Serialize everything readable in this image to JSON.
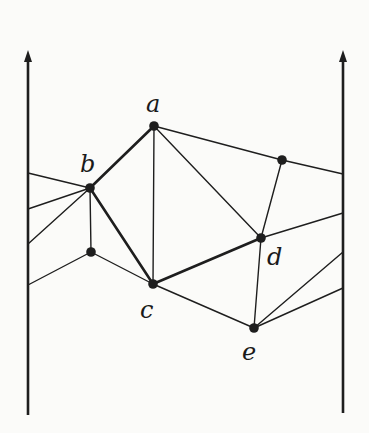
{
  "diagram": {
    "type": "planar-subdivision-between-walls",
    "colors": {
      "ink": "#1e1e1e",
      "background": "#fbfbf9"
    },
    "boundaries": [
      {
        "name": "left-wall",
        "x": 28,
        "y_top": 50,
        "y_bottom": 415,
        "arrow": "up"
      },
      {
        "name": "right-wall",
        "x": 343,
        "y_top": 50,
        "y_bottom": 413,
        "arrow": "up"
      }
    ],
    "vertices": [
      {
        "id": "a",
        "label": "a",
        "x": 154,
        "y": 126,
        "lx": 146,
        "ly": 112
      },
      {
        "id": "b",
        "label": "b",
        "x": 90,
        "y": 188,
        "lx": 80,
        "ly": 172
      },
      {
        "id": "c",
        "label": "c",
        "x": 153,
        "y": 284,
        "lx": 140,
        "ly": 318
      },
      {
        "id": "d",
        "label": "d",
        "x": 261,
        "y": 238,
        "lx": 267,
        "ly": 265
      },
      {
        "id": "e",
        "label": "e",
        "x": 254,
        "y": 328,
        "lx": 242,
        "ly": 360
      },
      {
        "id": "p",
        "label": "",
        "x": 282,
        "y": 160
      },
      {
        "id": "q",
        "label": "",
        "x": 91,
        "y": 252
      }
    ],
    "wall_points": {
      "L1": {
        "x": 28,
        "y": 173
      },
      "L2": {
        "x": 28,
        "y": 209
      },
      "L3": {
        "x": 28,
        "y": 244
      },
      "L4": {
        "x": 28,
        "y": 285
      },
      "R1": {
        "x": 343,
        "y": 174
      },
      "R2": {
        "x": 343,
        "y": 213
      },
      "R3": {
        "x": 343,
        "y": 252
      },
      "R4": {
        "x": 343,
        "y": 288
      }
    },
    "edges": [
      {
        "from": "a",
        "to": "b",
        "bold": true
      },
      {
        "from": "b",
        "to": "c",
        "bold": true
      },
      {
        "from": "c",
        "to": "d",
        "bold": true
      },
      {
        "from": "a",
        "to": "c",
        "bold": false
      },
      {
        "from": "a",
        "to": "d",
        "bold": false
      },
      {
        "from": "a",
        "to": "p",
        "bold": false
      },
      {
        "from": "p",
        "to": "d",
        "bold": false
      },
      {
        "from": "p",
        "to": "R1",
        "bold": false
      },
      {
        "from": "b",
        "to": "L1",
        "bold": false
      },
      {
        "from": "b",
        "to": "L2",
        "bold": false
      },
      {
        "from": "b",
        "to": "L3",
        "bold": false
      },
      {
        "from": "b",
        "to": "q",
        "bold": false
      },
      {
        "from": "q",
        "to": "L4",
        "bold": false
      },
      {
        "from": "q",
        "to": "c",
        "bold": false
      },
      {
        "from": "c",
        "to": "e",
        "bold": false
      },
      {
        "from": "d",
        "to": "e",
        "bold": false
      },
      {
        "from": "d",
        "to": "R2",
        "bold": false
      },
      {
        "from": "e",
        "to": "R3",
        "bold": false
      },
      {
        "from": "e",
        "to": "R4",
        "bold": false
      }
    ]
  }
}
